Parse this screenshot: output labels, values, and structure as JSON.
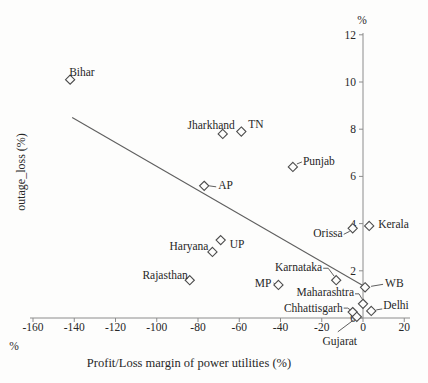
{
  "chart_data": {
    "type": "scatter",
    "title": "",
    "xlabel": "Profit/Loss margin of power utilities (%)",
    "ylabel": "outage_loss (%)",
    "x_axis_unit": "%",
    "y_axis_unit": "%",
    "xlim": [
      -160,
      20
    ],
    "ylim": [
      0,
      12
    ],
    "x_ticks": [
      -160,
      -140,
      -120,
      -100,
      -80,
      -60,
      -40,
      -20,
      0,
      20
    ],
    "y_ticks": [
      0,
      2,
      4,
      6,
      8,
      10,
      12
    ],
    "grid": false,
    "legend": false,
    "marker": "open-diamond",
    "series": [
      {
        "name": "states",
        "points": [
          {
            "label": "Bihar",
            "x": -142,
            "y": 10.1
          },
          {
            "label": "Jharkhand",
            "x": -68,
            "y": 7.8
          },
          {
            "label": "TN",
            "x": -59,
            "y": 7.9
          },
          {
            "label": "Punjab",
            "x": -34,
            "y": 6.4
          },
          {
            "label": "AP",
            "x": -77,
            "y": 5.6
          },
          {
            "label": "UP",
            "x": -69,
            "y": 3.3
          },
          {
            "label": "Haryana",
            "x": -73,
            "y": 2.8
          },
          {
            "label": "Rajasthan",
            "x": -84,
            "y": 1.6
          },
          {
            "label": "MP",
            "x": -41,
            "y": 1.4
          },
          {
            "label": "Karnataka",
            "x": -13,
            "y": 1.6
          },
          {
            "label": "Orissa",
            "x": -5,
            "y": 3.8
          },
          {
            "label": "Kerala",
            "x": 3,
            "y": 3.9
          },
          {
            "label": "WB",
            "x": 1,
            "y": 1.3
          },
          {
            "label": "Maharashtra",
            "x": 0,
            "y": 0.6
          },
          {
            "label": "Chhattisgarh",
            "x": -5,
            "y": 0.25
          },
          {
            "label": "Delhi",
            "x": 4,
            "y": 0.3
          },
          {
            "label": "Gujarat",
            "x": -3,
            "y": 0.05
          }
        ]
      }
    ],
    "trend_line": {
      "x1": -141,
      "y1": 8.5,
      "x2": 2,
      "y2": 1.27
    },
    "label_layout": {
      "Bihar": {
        "anchor": "start",
        "dx": -1,
        "dy": -4
      },
      "Jharkhand": {
        "anchor": "end",
        "dx": 12,
        "dy": -5
      },
      "TN": {
        "anchor": "start",
        "dx": 7,
        "dy": -4
      },
      "Punjab": {
        "anchor": "start",
        "dx": 10,
        "dy": -2,
        "leader": [
          [
            4,
            -3
          ],
          [
            9,
            -5
          ]
        ]
      },
      "AP": {
        "anchor": "start",
        "dx": 14,
        "dy": 3,
        "leader": [
          [
            5,
            0
          ],
          [
            12,
            1
          ]
        ]
      },
      "UP": {
        "anchor": "start",
        "dx": 9,
        "dy": 8
      },
      "Haryana": {
        "anchor": "end",
        "dx": -4,
        "dy": -2
      },
      "Rajasthan": {
        "anchor": "end",
        "dx": -2,
        "dy": -1
      },
      "MP": {
        "anchor": "end",
        "dx": -7,
        "dy": 2,
        "leader": [
          [
            -5,
            -2
          ],
          [
            -2,
            0
          ]
        ]
      },
      "Karnataka": {
        "anchor": "end",
        "dx": -14,
        "dy": -9,
        "leader": [
          [
            -13,
            -12
          ],
          [
            -8,
            -12
          ],
          [
            -2,
            -4
          ]
        ]
      },
      "Orissa": {
        "anchor": "end",
        "dx": -10,
        "dy": 9,
        "leader": [
          [
            -9,
            6
          ],
          [
            -3,
            3
          ]
        ]
      },
      "Kerala": {
        "anchor": "start",
        "dx": 9,
        "dy": 2
      },
      "WB": {
        "anchor": "start",
        "dx": 20,
        "dy": 0,
        "leader": [
          [
            6,
            -1
          ],
          [
            18,
            -3
          ]
        ]
      },
      "Maharashtra": {
        "anchor": "end",
        "dx": -9,
        "dy": -8,
        "leader": [
          [
            -8,
            -10
          ],
          [
            -4,
            -10
          ],
          [
            -1,
            -5
          ]
        ]
      },
      "Chhattisgarh": {
        "anchor": "end",
        "dx": -10,
        "dy": 0,
        "leader": [
          [
            -9,
            -4
          ],
          [
            -5,
            -4
          ],
          [
            -2,
            -2
          ]
        ]
      },
      "Delhi": {
        "anchor": "start",
        "dx": 12,
        "dy": -2,
        "leader": [
          [
            5,
            -1
          ],
          [
            11,
            -2
          ]
        ]
      },
      "Gujarat": {
        "anchor": "middle",
        "dx": -17,
        "dy": 28,
        "leader": [
          [
            -19,
            15
          ],
          [
            -3,
            3
          ]
        ]
      }
    },
    "colors": {
      "axis": "#8c8c8c",
      "marker_stroke": "#4c4c4c",
      "trend": "#5f5f5f",
      "text": "#272727",
      "background": "#fdfdfc"
    }
  }
}
